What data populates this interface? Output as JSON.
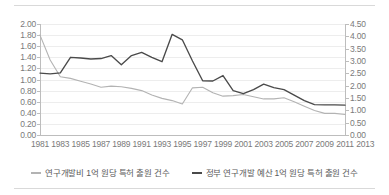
{
  "chart_data": {
    "type": "line",
    "title": "",
    "subtitle": "",
    "xlabel": "",
    "ylabel": "",
    "grid": true,
    "legend_position": "bottom",
    "x": [
      1981,
      1982,
      1983,
      1984,
      1985,
      1986,
      1987,
      1988,
      1989,
      1990,
      1991,
      1992,
      1993,
      1994,
      1995,
      1996,
      1997,
      1998,
      1999,
      2000,
      2001,
      2002,
      2003,
      2004,
      2005,
      2006,
      2007,
      2008,
      2009,
      2010,
      2011
    ],
    "xticks": [
      "1981",
      "1983",
      "1985",
      "1987",
      "1989",
      "1991",
      "1993",
      "1995",
      "1997",
      "1999",
      "2001",
      "2003",
      "2005",
      "2007",
      "2009",
      "2011",
      "2013"
    ],
    "left_axis": {
      "ylim": [
        0.0,
        2.0
      ],
      "ystep": 0.2,
      "yticks": [
        "0.00",
        "0.20",
        "0.40",
        "0.60",
        "0.80",
        "1.00",
        "1.20",
        "1.40",
        "1.60",
        "1.80",
        "2.00"
      ]
    },
    "right_axis": {
      "ylim": [
        0.0,
        4.5
      ],
      "ystep": 0.5,
      "yticks": [
        "0.00",
        "0.50",
        "1.00",
        "1.50",
        "2.00",
        "2.50",
        "3.00",
        "3.50",
        "4.00",
        "4.50"
      ]
    },
    "series": [
      {
        "name": "연구개발비 1억 원당 특허 출원 건수",
        "axis": "left",
        "color": "#b3b3b3",
        "values": [
          1.8,
          1.35,
          1.05,
          1.02,
          0.97,
          0.92,
          0.86,
          0.88,
          0.87,
          0.84,
          0.8,
          0.72,
          0.66,
          0.62,
          0.56,
          0.85,
          0.86,
          0.76,
          0.7,
          0.71,
          0.73,
          0.69,
          0.65,
          0.65,
          0.67,
          0.6,
          0.52,
          0.44,
          0.39,
          0.39,
          0.37
        ]
      },
      {
        "name": "정부 연구개발 예산 1억 원당 특허 출원 건수",
        "axis": "right",
        "color": "#4a4a4a",
        "values": [
          2.51,
          2.48,
          2.52,
          3.15,
          3.12,
          3.08,
          3.1,
          3.22,
          2.85,
          3.22,
          3.35,
          3.15,
          2.97,
          4.08,
          3.86,
          3.0,
          2.2,
          2.19,
          2.41,
          1.8,
          1.68,
          1.84,
          2.06,
          1.92,
          1.84,
          1.62,
          1.39,
          1.23,
          1.22,
          1.22,
          1.21
        ]
      }
    ]
  },
  "legend": {
    "items": [
      {
        "label": "연구개발비 1억 원당 특허 출원 건수",
        "color": "#b3b3b3"
      },
      {
        "label": "정부 연구개발 예산 1억 원당 특허 출원 건수",
        "color": "#4a4a4a"
      }
    ]
  }
}
